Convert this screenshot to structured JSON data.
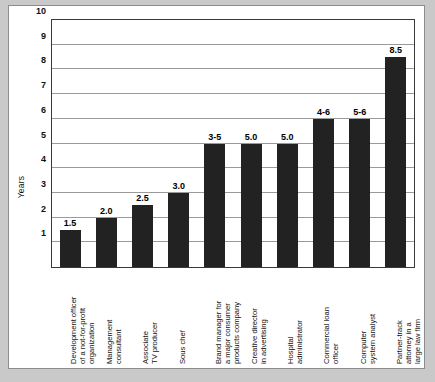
{
  "chart_data": {
    "type": "bar",
    "title": "",
    "xlabel": "",
    "ylabel": "Years",
    "ylim": [
      0,
      10
    ],
    "yticks": [
      1,
      2,
      3,
      4,
      5,
      6,
      7,
      8,
      9,
      10
    ],
    "grid": true,
    "legend": false,
    "bar_color": "#222222",
    "categories": [
      "Development officer\nof a not-for-profit\norganization",
      "Management\nconsultant",
      "Associate\nTV producer",
      "Sous chef",
      "Brand manager for\na major consumer\nproducts company",
      "Creative director\nin advertising",
      "Hospital\nadministrator",
      "Commercial loan\nofficer",
      "Computer\nsystem analyst",
      "Partner-track\nattorney in a\nlarge law firm"
    ],
    "labels": [
      "1.5",
      "2.0",
      "2.5",
      "3.0",
      "3-5",
      "5.0",
      "5.0",
      "4-6",
      "5-6",
      "8.5"
    ],
    "values": [
      1.5,
      2.0,
      2.5,
      3.0,
      5.0,
      5.0,
      5.0,
      6.0,
      6.0,
      8.5
    ]
  }
}
